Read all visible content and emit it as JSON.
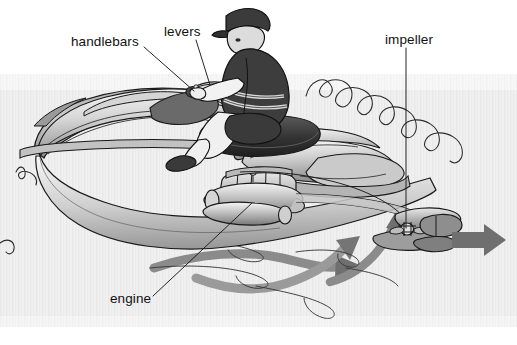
{
  "figure": {
    "width": 517,
    "height": 345,
    "background_color": "#ffffff",
    "water_texture_color": "#ececed",
    "ink_color": "#1a1a1a"
  },
  "labels": {
    "handlebars": "handlebars",
    "levers": "levers",
    "impeller": "impeller",
    "engine": "engine"
  },
  "colors": {
    "hull_light": "#f2f2f2",
    "hull_mid": "#b8b8b8",
    "hull_dark": "#6e6e6e",
    "seat_dark": "#3a3a3a",
    "rider_dark": "#3d3d3d",
    "rider_skin": "#d9d9d9",
    "arrow_gray": "#7a7a7a",
    "outline": "#1a1a1a"
  },
  "annotations": {
    "thrust_arrow": "water jet thrust direction",
    "intake_arrows": "water intake flow direction"
  }
}
